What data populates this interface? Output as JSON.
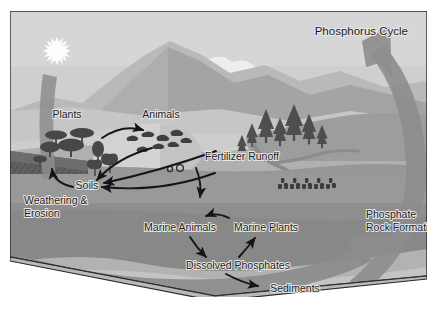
{
  "figure": {
    "title": "Phosphorus Cycle",
    "kind": "labeled-diagram",
    "frame_border_color": "#2b2b2b",
    "background_color": "#ffffff"
  },
  "palette": {
    "sky": "#d5d5d5",
    "sky_lower": "#cfcfcf",
    "sun": "#fdfdfd",
    "cloud": "#ededed",
    "mountain_far": "#b9b9b9",
    "mountain_near": "#a8a8a8",
    "hill_light": "#c8c8c8",
    "land_mid": "#9a9a9a",
    "land_dark": "#8a8a8a",
    "cliff_dark": "#5f5f5f",
    "ocean": "#8e8e8e",
    "ocean_deep": "#7e7e7e",
    "seafloor": "#b5b5b5",
    "box_base": "#cccccc",
    "big_arrow": "#8d8d8d",
    "big_arrow_alt": "#9c9c9c",
    "vegetation": "#4a4a4a",
    "arrow_black": "#151515",
    "label_text": "#1b1b1b"
  },
  "labels": [
    {
      "id": "title",
      "text": "Phosphorus Cycle",
      "x": 398,
      "y": 24,
      "anchor": "end",
      "size": 11.5
    },
    {
      "id": "plants",
      "text": "Plants",
      "x": 57,
      "y": 107,
      "anchor": "middle",
      "size": 10.5
    },
    {
      "id": "animals",
      "text": "Animals",
      "x": 151,
      "y": 107,
      "anchor": "middle",
      "size": 10.5
    },
    {
      "id": "fertilizer",
      "text": "Fertilizer Runoff",
      "x": 232,
      "y": 149,
      "anchor": "middle",
      "size": 10.5
    },
    {
      "id": "soils",
      "text": "Soils",
      "x": 77,
      "y": 174,
      "anchor": "middle",
      "size": 10.5
    },
    {
      "id": "weathering1",
      "text": "Weathering &",
      "x": 14,
      "y": 190,
      "anchor": "start",
      "size": 10.5
    },
    {
      "id": "weathering2",
      "text": "Erosion",
      "x": 14,
      "y": 203,
      "anchor": "start",
      "size": 10.5
    },
    {
      "id": "marine_animals",
      "text": "Marine Animals",
      "x": 170,
      "y": 218,
      "anchor": "middle",
      "size": 10.5
    },
    {
      "id": "marine_plants",
      "text": "Marine Plants",
      "x": 256,
      "y": 218,
      "anchor": "middle",
      "size": 10.5
    },
    {
      "id": "dissolved",
      "text": "Dissolved Phosphates",
      "x": 228,
      "y": 257,
      "anchor": "middle",
      "size": 10.5
    },
    {
      "id": "sediments",
      "text": "Sediments",
      "x": 285,
      "y": 281,
      "anchor": "middle",
      "size": 10.5
    },
    {
      "id": "phosphate1",
      "text": "Phosphate",
      "x": 358,
      "y": 207,
      "anchor": "start",
      "size": 10.5
    },
    {
      "id": "phosphate2",
      "text": "Rock Formation",
      "x": 358,
      "y": 220,
      "anchor": "start",
      "size": 10.5
    }
  ],
  "flow_arrows": [
    {
      "id": "plants-to-animals",
      "from": "Plants",
      "to": "Animals"
    },
    {
      "id": "animals-to-soils",
      "from": "Animals",
      "to": "Soils"
    },
    {
      "id": "land-to-soils",
      "from": "Land",
      "to": "Soils"
    },
    {
      "id": "soils-to-weathering",
      "from": "Soils",
      "to": "Weathering & Erosion"
    },
    {
      "id": "fertilizer-runoff-down",
      "from": "Fertilizer Runoff",
      "to": "Ocean"
    },
    {
      "id": "marine-plants-to-animals",
      "from": "Marine Plants",
      "to": "Marine Animals"
    },
    {
      "id": "marine-animals-to-dissolved",
      "from": "Marine Animals",
      "to": "Dissolved Phosphates"
    },
    {
      "id": "dissolved-to-marine-plants",
      "from": "Dissolved Phosphates",
      "to": "Marine Plants"
    },
    {
      "id": "dissolved-to-sediments",
      "from": "Dissolved Phosphates",
      "to": "Sediments"
    }
  ],
  "major_arrows": [
    {
      "id": "uplift-arrow",
      "label": "Phosphate Rock Formation",
      "direction": "up",
      "side": "right"
    },
    {
      "id": "seafloor-arrow",
      "label": "Sediments to uplift",
      "direction": "up-right",
      "side": "bottom"
    },
    {
      "id": "weathering-arrow",
      "label": "Weathering & Erosion",
      "direction": "down",
      "side": "left"
    }
  ],
  "scene_elements": [
    {
      "id": "sun",
      "name": "sun"
    },
    {
      "id": "cloud",
      "name": "cloud"
    },
    {
      "id": "mountains",
      "name": "mountain-range"
    },
    {
      "id": "conifers",
      "name": "conifer-trees"
    },
    {
      "id": "shrubs",
      "name": "shrubs-and-trees"
    },
    {
      "id": "cattle",
      "name": "cattle-herd"
    },
    {
      "id": "river",
      "name": "river"
    },
    {
      "id": "ocean",
      "name": "ocean"
    },
    {
      "id": "seafloor",
      "name": "seafloor-sediment"
    },
    {
      "id": "cliff",
      "name": "eroding-cliff-face"
    }
  ]
}
